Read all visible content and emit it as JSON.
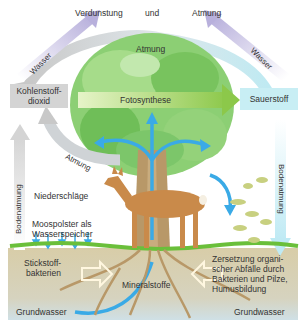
{
  "diagram": {
    "title_row": {
      "left": "Verdunstung",
      "middle": "und",
      "right": "Atmung"
    },
    "arrows": {
      "water_left": "Wasser",
      "water_right": "Wasser",
      "atmung_top": "Atmung",
      "atmung_lower_left": "Atmung",
      "fotosynthese": "Fotosynthese",
      "bodenatmung_left": "Bodenatmung",
      "bodenatmung_right": "Bodenatmung"
    },
    "boxes": {
      "co2": "Kohlenstoff-\ndioxid",
      "co2_line1": "Kohlenstoff-",
      "co2_line2": "dioxid",
      "o2": "Sauerstoff"
    },
    "labels": {
      "niederschlaege": "Niederschläge",
      "moospolster_line1": "Moospolster als",
      "moospolster_line2": "Wasserspeicher",
      "stickstoff_line1": "Stickstoff-",
      "stickstoff_line2": "bakterien",
      "mineralstoffe": "Mineralstoffe",
      "zersetzung_line1": "Zersetzung organi-",
      "zersetzung_line2": "scher Abfälle durch",
      "zersetzung_line3": "Bakterien und Pilze,",
      "zersetzung_line4": "Humusbildung",
      "grundwasser_left": "Grundwasser",
      "grundwasser_right": "Grundwasser"
    },
    "colors": {
      "water_arrow": "#c9c3e0",
      "atmung_arrow": "#cfd3d6",
      "co2_box": "#d4d4d4",
      "o2_box": "#c8eef4",
      "fotosynthese_arrow": "#a8d86a",
      "tree_canopy": "#7cc66a",
      "water_blue": "#3aaae6",
      "soil": "#d9cfb0",
      "grass": "#6abf3a",
      "deer": "#c98a4a"
    }
  }
}
